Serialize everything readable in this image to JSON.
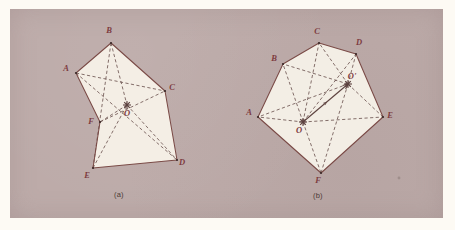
{
  "figure": {
    "background_color": "#fdfaf4",
    "panel_color": "#bcaaa8",
    "ink_color": "#7a4a46",
    "label_color": "#7d3b40",
    "fill_color": "#f7f3ea",
    "captions": [
      {
        "id": "caption-a",
        "text": "(a)",
        "x": 122,
        "y": 195
      },
      {
        "id": "caption-b",
        "text": "(b)",
        "x": 321,
        "y": 196
      }
    ]
  },
  "diagram_a": {
    "name": "hexagon-with-center-o",
    "outline_order": [
      "A",
      "B",
      "C",
      "D",
      "E",
      "F"
    ],
    "vertices": [
      {
        "label": "A",
        "x": 76,
        "y": 73,
        "lx": 66,
        "ly": 71
      },
      {
        "label": "B",
        "x": 111,
        "y": 43,
        "lx": 109,
        "ly": 33
      },
      {
        "label": "C",
        "x": 165,
        "y": 91,
        "lx": 172,
        "ly": 90
      },
      {
        "label": "D",
        "x": 177,
        "y": 160,
        "lx": 182,
        "ly": 165
      },
      {
        "label": "E",
        "x": 93,
        "y": 168,
        "lx": 87,
        "ly": 178
      },
      {
        "label": "F",
        "x": 100,
        "y": 122,
        "lx": 91,
        "ly": 124
      }
    ],
    "center": {
      "label": "O",
      "x": 127,
      "y": 105,
      "lx": 127,
      "ly": 116
    },
    "dashed_segments": [
      [
        "A",
        "C"
      ],
      [
        "B",
        "E"
      ],
      [
        "A",
        "D"
      ],
      [
        "F",
        "C"
      ],
      [
        "B",
        "O"
      ],
      [
        "E",
        "O"
      ],
      [
        "O",
        "D"
      ],
      [
        "O",
        "F"
      ]
    ]
  },
  "diagram_b": {
    "name": "hexagon-with-two-centers",
    "outline_order": [
      "A",
      "B",
      "C",
      "D",
      "E",
      "F"
    ],
    "vertices": [
      {
        "label": "A",
        "x": 258,
        "y": 117,
        "lx": 249,
        "ly": 115
      },
      {
        "label": "B",
        "x": 283,
        "y": 64,
        "lx": 274,
        "ly": 61
      },
      {
        "label": "C",
        "x": 319,
        "y": 43,
        "lx": 317,
        "ly": 34
      },
      {
        "label": "D",
        "x": 356,
        "y": 54,
        "lx": 359,
        "ly": 45
      },
      {
        "label": "E",
        "x": 383,
        "y": 117,
        "lx": 390,
        "ly": 118
      },
      {
        "label": "F",
        "x": 321,
        "y": 173,
        "lx": 318,
        "ly": 183
      }
    ],
    "centers": [
      {
        "label": "O",
        "x": 303,
        "y": 122,
        "lx": 299,
        "ly": 133
      },
      {
        "label": "O'",
        "x": 348,
        "y": 84,
        "lx": 352,
        "ly": 79
      }
    ],
    "dashed_from_o": [
      "A",
      "B",
      "C",
      "D",
      "E",
      "F"
    ],
    "dashed_from_o2": [
      "A",
      "B",
      "C",
      "D",
      "E",
      "F"
    ],
    "arrow_segment": {
      "from": "O",
      "to": "O'"
    },
    "speck": {
      "x": 399,
      "y": 178
    }
  }
}
